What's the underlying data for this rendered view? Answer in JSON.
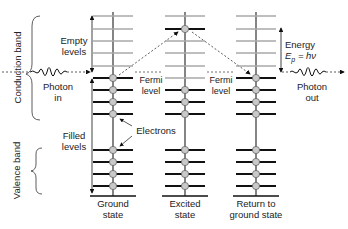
{
  "bands": {
    "conduction": "Conduction band",
    "valence": "Valence band"
  },
  "labels": {
    "empty_levels_1": "Empty",
    "empty_levels_2": "levels",
    "filled_levels_1": "Filled",
    "filled_levels_2": "levels",
    "photon_in_1": "Photon",
    "photon_in_2": "in",
    "photon_out_1": "Photon",
    "photon_out_2": "out",
    "fermi_1a": "Fermi",
    "fermi_1b": "level",
    "fermi_2a": "Fermi",
    "fermi_2b": "level",
    "electrons": "Electrons",
    "energy": "Energy",
    "energy_eq": "Ep = hν",
    "energy_eq_E": "E",
    "energy_eq_sub": "p",
    "energy_eq_rest": " = hν"
  },
  "states": [
    {
      "line1": "Ground",
      "line2": "state",
      "x": 113,
      "electrons": [
        78,
        90,
        102,
        114,
        150,
        162,
        174,
        186
      ]
    },
    {
      "line1": "Excited",
      "line2": "state",
      "x": 185,
      "electrons": [
        29,
        90,
        102,
        114,
        150,
        162,
        174,
        186
      ]
    },
    {
      "line1": "Return to",
      "line2": "ground state",
      "x": 256,
      "electrons": [
        78,
        90,
        102,
        114,
        150,
        162,
        174,
        186
      ]
    }
  ],
  "levels": {
    "empty_y": [
      16,
      29,
      41,
      53,
      66
    ],
    "filled_y": [
      78,
      90,
      102,
      114,
      150,
      162,
      174,
      186
    ],
    "baseline_y": 196,
    "fermi_y": 72
  },
  "colors": {
    "empty_level": "#a8a8a8",
    "filled_level": "#111111",
    "electron_fill": "#c9c9c9",
    "electron_stroke": "#666666",
    "text": "#222222"
  }
}
